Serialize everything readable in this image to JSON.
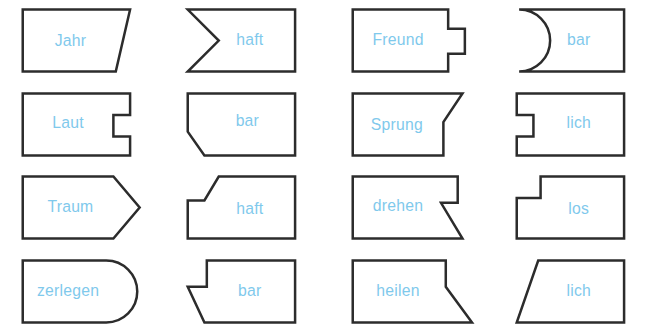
{
  "canvas": {
    "width": 659,
    "height": 334,
    "background": "#ffffff",
    "outline_color": "#2c2c2c",
    "label_color": "#7fc9ec"
  },
  "grid": {
    "columns": 4,
    "rows": 4
  },
  "tiles": [
    {
      "label": "Jahr",
      "shape": "right-edge-slanted-inward",
      "row": 1,
      "column": 1,
      "points": "10,8 100,8 88,60 10,60",
      "label_x": 50,
      "label_y": 35
    },
    {
      "label": "haft",
      "shape": "left-edge-v-notch-inward",
      "row": 1,
      "column": 2,
      "points": "10,8 100,8 100,60 10,60 36,34",
      "label_x": 62,
      "label_y": 34
    },
    {
      "label": "Freund",
      "shape": "right-edge-tab-outward",
      "row": 1,
      "column": 3,
      "points": "10,8 90,8 90,24 104,24 104,45 90,45 90,60 10,60",
      "label_x": 48,
      "label_y": 34
    },
    {
      "label": "bar",
      "shape": "left-edge-concave-arc",
      "row": 1,
      "column": 4,
      "path": "M 12,8 L 100,8 L 100,60 L 12,60 A 26 26 0 0 0 12 8 Z",
      "label_x": 62,
      "label_y": 34
    },
    {
      "label": "Laut",
      "shape": "right-edge-notch-inward",
      "row": 2,
      "column": 1,
      "points": "10,8 100,8 100,26 86,26 86,44 100,44 100,60 10,60",
      "label_x": 48,
      "label_y": 33
    },
    {
      "label": "bar",
      "shape": "left-bottom-slant-inward",
      "row": 2,
      "column": 2,
      "points": "10,8 100,8 100,60 24,60 10,40",
      "label_x": 60,
      "label_y": 32
    },
    {
      "label": "Sprung",
      "shape": "right-top-diagonal-step",
      "row": 2,
      "column": 3,
      "points": "10,8 102,8 86,32 86,60 10,60",
      "label_x": 47,
      "label_y": 35
    },
    {
      "label": "lich",
      "shape": "left-edge-notch-inward",
      "row": 2,
      "column": 4,
      "points": "10,8 100,8 100,60 10,60 10,44 24,44 24,26 10,26",
      "label_x": 62,
      "label_y": 33
    },
    {
      "label": "Traum",
      "shape": "right-arrow-point-outward",
      "row": 3,
      "column": 1,
      "points": "10,8 86,8 108,34 86,60 10,60",
      "label_x": 50,
      "label_y": 34
    },
    {
      "label": "haft",
      "shape": "top-left-diagonal-cut",
      "row": 3,
      "column": 2,
      "points": "36,8 100,8 100,60 10,60 10,28 24,28",
      "label_x": 62,
      "label_y": 36
    },
    {
      "label": "drehen",
      "shape": "right-step-with-flare",
      "row": 3,
      "column": 3,
      "points": "10,8 98,8 98,30 84,30 102,60 10,60",
      "label_x": 48,
      "label_y": 33
    },
    {
      "label": "los",
      "shape": "top-left-step-cut",
      "row": 3,
      "column": 4,
      "points": "30,8 100,8 100,60 10,60 10,26 30,26",
      "label_x": 62,
      "label_y": 36
    },
    {
      "label": "zerlegen",
      "shape": "right-edge-rounded-outward",
      "row": 4,
      "column": 1,
      "path": "M 10,8 L 80,8 A 26 26 0 0 1 80 60 L 10,60 Z",
      "label_x": 48,
      "label_y": 34
    },
    {
      "label": "bar",
      "shape": "left-step-with-slant",
      "row": 4,
      "column": 2,
      "points": "26,8 100,8 100,60 24,60 10,30 26,30",
      "label_x": 62,
      "label_y": 34
    },
    {
      "label": "heilen",
      "shape": "right-flare-outward",
      "row": 4,
      "column": 3,
      "points": "10,8 88,8 88,30 110,60 10,60",
      "label_x": 48,
      "label_y": 34
    },
    {
      "label": "lich",
      "shape": "left-edge-slanted-outward",
      "row": 4,
      "column": 4,
      "points": "28,8 100,8 100,60 10,60",
      "label_x": 62,
      "label_y": 34
    }
  ]
}
